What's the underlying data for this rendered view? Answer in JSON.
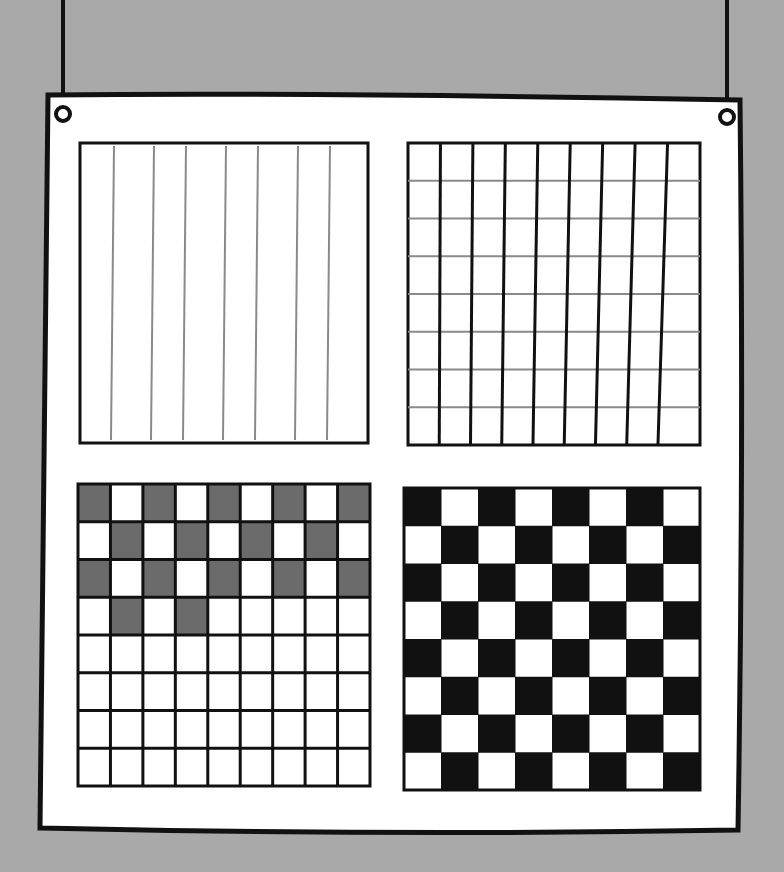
{
  "scene": {
    "background": "#a9a9a9",
    "board_fill": "#ffffff",
    "ink": "#111111",
    "pencil": "#8a8a8a",
    "shade": "#6b6b6b"
  },
  "panels": [
    {
      "name": "vertical-lines",
      "description": "8 thin gray vertical lines",
      "cols": 8,
      "rows": 0
    },
    {
      "name": "grid",
      "description": "9 columns x 8 rows, black verticals, gray horizontals",
      "cols": 9,
      "rows": 8
    },
    {
      "name": "partial-checkerboard",
      "description": "9x8 grid with top 4 rows gray checker pattern",
      "cols": 9,
      "rows": 8,
      "shaded_cells": [
        [
          0,
          0
        ],
        [
          0,
          2
        ],
        [
          0,
          4
        ],
        [
          0,
          6
        ],
        [
          0,
          8
        ],
        [
          1,
          1
        ],
        [
          1,
          3
        ],
        [
          1,
          5
        ],
        [
          1,
          7
        ],
        [
          2,
          0
        ],
        [
          2,
          2
        ],
        [
          2,
          4
        ],
        [
          2,
          6
        ],
        [
          2,
          8
        ],
        [
          3,
          1
        ],
        [
          3,
          3
        ]
      ]
    },
    {
      "name": "full-checkerboard",
      "description": "8x8 black and white checkerboard",
      "cols": 8,
      "rows": 8
    }
  ]
}
